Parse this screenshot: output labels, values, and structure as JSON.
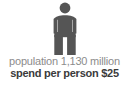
{
  "infographic": {
    "type": "pictogram-stat-card",
    "background_color": "#ffffff",
    "icon": {
      "name": "person-figure-icon",
      "semantic": "population-person-pictogram",
      "color": "#555555"
    },
    "stats": [
      {
        "id": "population",
        "text": "population 1,130 million",
        "label": "population",
        "value": "1,130",
        "unit": "million",
        "color": "#8c8c8c",
        "weight": "regular"
      },
      {
        "id": "spend_per_person",
        "text": "spend per person $25",
        "label": "spend per person",
        "value": "$25",
        "unit": "",
        "color": "#3b3b3b",
        "weight": "bold"
      }
    ]
  }
}
